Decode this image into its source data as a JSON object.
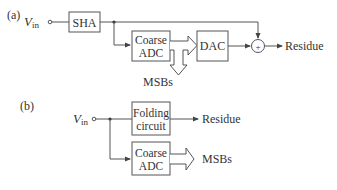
{
  "diagram": {
    "part_a": {
      "label": "(a)",
      "input": {
        "symbol": "V",
        "subscript": "in"
      },
      "blocks": {
        "sha": "SHA",
        "coarse_adc_line1": "Coarse",
        "coarse_adc_line2": "ADC",
        "dac": "DAC"
      },
      "summing_symbol": "+",
      "outputs": {
        "residue": "Residue",
        "msbs": "MSBs"
      }
    },
    "part_b": {
      "label": "(b)",
      "input": {
        "symbol": "V",
        "subscript": "in"
      },
      "blocks": {
        "folding_line1": "Folding",
        "folding_line2": "circuit",
        "coarse_adc_line1": "Coarse",
        "coarse_adc_line2": "ADC"
      },
      "outputs": {
        "residue": "Residue",
        "msbs": "MSBs"
      }
    },
    "colors": {
      "line": "#555555",
      "text": "#333333",
      "background": "#ffffff"
    }
  }
}
